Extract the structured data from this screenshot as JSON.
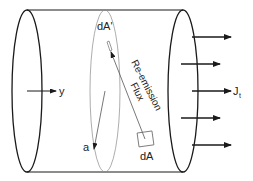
{
  "diagram": {
    "colors": {
      "stroke": "#1a1a1a",
      "thin_stroke": "#8a8a8a",
      "background": "#ffffff"
    },
    "labels": {
      "dA_prime": "dA'",
      "dA": "dA",
      "a": "a",
      "y": "y",
      "J": "J",
      "J_sub": "t",
      "reemission_line1": "Re-emission",
      "reemission_line2": "Flux"
    },
    "elements": {
      "cylinder": {
        "left_end": {
          "cx": 27,
          "cy": 91,
          "rx": 15,
          "ry": 81
        },
        "middle_section": {
          "cx": 105,
          "cy": 91,
          "rx": 15,
          "ry": 81
        },
        "right_end": {
          "cx": 183,
          "cy": 91,
          "rx": 15,
          "ry": 81
        },
        "top_edge_y": 10,
        "bottom_edge_y": 172
      },
      "outflow_arrows": [
        {
          "x1": 192,
          "x2": 231,
          "y": 37
        },
        {
          "x1": 181,
          "x2": 220,
          "y": 64
        },
        {
          "x1": 192,
          "x2": 231,
          "y": 91
        },
        {
          "x1": 181,
          "x2": 220,
          "y": 118
        },
        {
          "x1": 192,
          "x2": 231,
          "y": 145
        }
      ]
    }
  }
}
